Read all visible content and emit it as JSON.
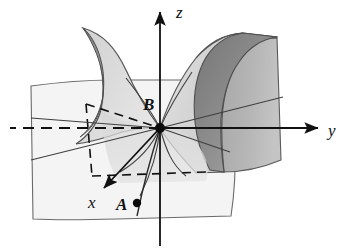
{
  "figure": {
    "kind": "math-surface-diagram",
    "background_color": "#ffffff",
    "stroke_color": "#3a3a3a",
    "axis_color": "#111111"
  },
  "axes": [
    {
      "name": "z-axis",
      "label": "z",
      "direction": "up",
      "label_x": 176,
      "label_y": 15,
      "arrow": true
    },
    {
      "name": "y-axis",
      "label": "y",
      "direction": "right",
      "label_x": 331,
      "label_y": 134,
      "arrow": true
    },
    {
      "name": "x-axis",
      "label": "x",
      "direction": "down-left",
      "label_x": 90,
      "label_y": 205,
      "arrow": true
    }
  ],
  "points": [
    {
      "name": "origin-point-B",
      "label": "B",
      "x": 160,
      "y": 128,
      "label_x": 145,
      "label_y": 105,
      "marker": "filled-dot",
      "marker_radius": 5
    },
    {
      "name": "curve-point-A",
      "label": "A",
      "x": 137,
      "y": 203,
      "label_x": 118,
      "label_y": 210,
      "marker": "filled-dot",
      "marker_radius": 4
    }
  ],
  "colors": {
    "plane_light": "#f4f4f4",
    "surface_light": "#dcdcdc",
    "surface_mid": "#c9c9c9",
    "surface_dark": "#a8a8a8",
    "horn_interior_dark": "#8f8f8f",
    "horn_interior_darker": "#787878",
    "outline": "#4a4a4a",
    "dashed": "#111111",
    "axis": "#111111",
    "label": "#101010"
  },
  "elements": [
    {
      "name": "left-base-plane",
      "kind": "quadrilateral-plane",
      "fill": "#f4f4f4"
    },
    {
      "name": "left-horn-surface",
      "kind": "curved-horn",
      "fill": "#d8d8d8"
    },
    {
      "name": "left-horn-interior",
      "kind": "ellipse-opening",
      "fill": "#8c8c8c"
    },
    {
      "name": "right-horn-surface",
      "kind": "curved-horn",
      "fill": "#cfcfcf"
    },
    {
      "name": "right-horn-interior",
      "kind": "ellipse-opening",
      "fill": "#909090"
    },
    {
      "name": "right-back-panel",
      "kind": "quadrilateral-plane",
      "fill": "#b4b4b4"
    },
    {
      "name": "dashed-projection-rectangle",
      "kind": "dashed-outline"
    },
    {
      "name": "radial-ruling-lines",
      "kind": "line-set",
      "count": 9
    },
    {
      "name": "curve-through-A",
      "kind": "curve"
    }
  ],
  "labels": {
    "z": "z",
    "y": "y",
    "x": "x",
    "A": "A",
    "B": "B"
  }
}
